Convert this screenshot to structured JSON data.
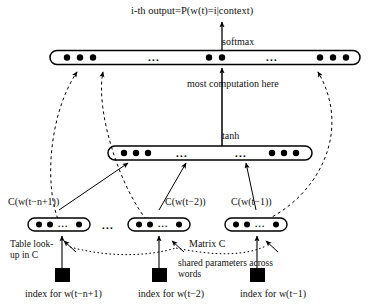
{
  "figure": {
    "type": "neural-network-architecture-diagram",
    "title": "i-th output=P(w(t)=i|context)",
    "labels": {
      "softmax": "softmax",
      "most_computation": "most computation here",
      "tanh": "tanh",
      "table_lookup": "Table look-up in C",
      "matrix_c": "Matrix C",
      "shared_parameters": "shared parameters across words"
    },
    "layers": {
      "output": {
        "name": "softmax",
        "ellipsis": [
          "...",
          "..."
        ],
        "dot_groups": [
          3,
          2,
          3
        ]
      },
      "hidden": {
        "name": "tanh",
        "ellipsis": [
          "...",
          "..."
        ],
        "dot_groups": [
          3,
          3
        ]
      }
    },
    "embeddings": [
      {
        "label": "C(w(t−n+1))",
        "dots_left": 2,
        "ellipsis": "...",
        "dots_right": 1
      },
      {
        "label": "C(w(t−2))",
        "dots_left": 2,
        "ellipsis": "...",
        "dots_right": 1
      },
      {
        "label": "C(w(t−1))",
        "dots_left": 2,
        "ellipsis": "...",
        "dots_right": 1
      }
    ],
    "between_embeddings_ellipsis": "...",
    "inputs": [
      {
        "label": "index for w(t−n+1)"
      },
      {
        "label": "index for w(t−2)"
      },
      {
        "label": "index for w(t−1)"
      }
    ],
    "colors": {
      "stroke": "#000000",
      "background": "#ffffff",
      "node_fill": "#000000"
    }
  }
}
